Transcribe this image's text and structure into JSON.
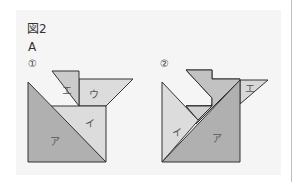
{
  "figure": {
    "title": "図2",
    "subtitle": "A",
    "colors": {
      "panel_bg": "#f5f5f5",
      "dark_piece": "#b0b0b0",
      "mid_piece": "#c8c8c8",
      "light_piece": "#dcdcdc",
      "outline": "#333333"
    },
    "arrangements": [
      {
        "number": "①",
        "pieces": [
          {
            "id": "a",
            "label": "ア"
          },
          {
            "id": "i",
            "label": "イ"
          },
          {
            "id": "u",
            "label": "ウ"
          },
          {
            "id": "e",
            "label": "エ"
          }
        ]
      },
      {
        "number": "②",
        "pieces": [
          {
            "id": "a",
            "label": "ア"
          },
          {
            "id": "i",
            "label": "イ"
          },
          {
            "id": "u",
            "label": ""
          },
          {
            "id": "e",
            "label": "エ"
          }
        ]
      }
    ]
  }
}
